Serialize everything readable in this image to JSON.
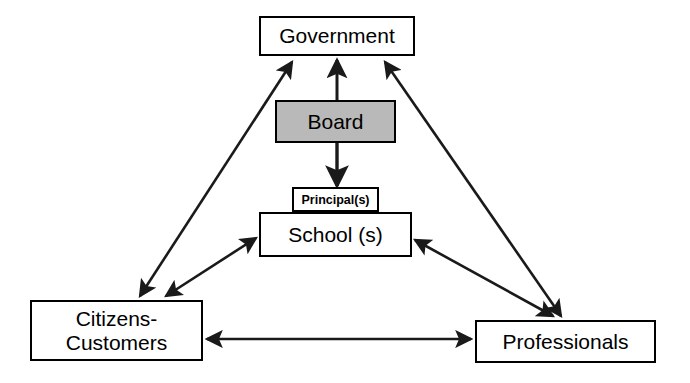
{
  "diagram": {
    "background_color": "#ffffff",
    "line_color": "#1a1a1a",
    "nodes": {
      "government": {
        "label": "Government",
        "fill": "#ffffff"
      },
      "board": {
        "label": "Board",
        "fill": "#b9b9b9"
      },
      "principals": {
        "label": "Principal(s)",
        "fill": "#ffffff"
      },
      "school": {
        "label": "School (s)",
        "fill": "#ffffff"
      },
      "citizens": {
        "label": "Citizens-\nCustomers",
        "fill": "#ffffff"
      },
      "professionals": {
        "label": "Professionals",
        "fill": "#ffffff"
      }
    },
    "edges": [
      {
        "name": "board-to-government",
        "from": "board",
        "to": "government",
        "style": "single-arrow-up"
      },
      {
        "name": "citizens-to-government",
        "from": "citizens",
        "to": "government",
        "style": "double-arrow"
      },
      {
        "name": "professionals-to-government",
        "from": "professionals",
        "to": "government",
        "style": "double-arrow"
      },
      {
        "name": "board-to-principals",
        "from": "board",
        "to": "principals",
        "style": "single-arrow-down"
      },
      {
        "name": "school-to-citizens",
        "from": "school",
        "to": "citizens",
        "style": "double-arrow"
      },
      {
        "name": "school-to-professionals",
        "from": "school",
        "to": "professionals",
        "style": "double-arrow"
      },
      {
        "name": "citizens-to-professionals",
        "from": "citizens",
        "to": "professionals",
        "style": "double-arrow"
      }
    ]
  }
}
